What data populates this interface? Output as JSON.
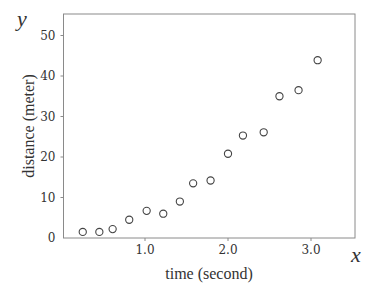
{
  "chart_data": {
    "type": "scatter",
    "title": "",
    "xlabel": "time (second)",
    "ylabel": "distance (meter)",
    "x_var": "x",
    "y_var": "y",
    "xlim": [
      0.0,
      3.5
    ],
    "ylim": [
      0,
      55
    ],
    "x_ticks": [
      1.0,
      2.0,
      3.0
    ],
    "x_tick_labels": [
      "1.0",
      "2.0",
      "3.0"
    ],
    "y_ticks": [
      0,
      10,
      20,
      30,
      40,
      50
    ],
    "y_tick_labels": [
      "0",
      "10",
      "20",
      "30",
      "40",
      "50"
    ],
    "grid": false,
    "legend": null,
    "marker": "open-circle",
    "series": [
      {
        "name": "measurements",
        "x": [
          0.25,
          0.45,
          0.61,
          0.81,
          1.02,
          1.22,
          1.42,
          1.58,
          1.79,
          2.0,
          2.18,
          2.43,
          2.62,
          2.85,
          3.08
        ],
        "y": [
          1.5,
          1.5,
          2.2,
          4.5,
          6.7,
          6.0,
          9.0,
          13.5,
          14.2,
          20.8,
          25.3,
          26.1,
          35.0,
          36.5,
          43.9
        ]
      }
    ]
  },
  "colors": {
    "frame": "#8a8a8a",
    "text": "#333333",
    "marker_stroke": "#444444",
    "background": "#ffffff"
  }
}
